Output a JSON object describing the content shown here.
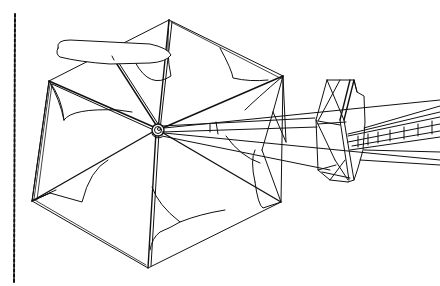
{
  "figure": {
    "type": "technical line drawing",
    "subject": "hexagonal umbrella-shaped deployable sail structure with central hub, paddle blade, and truss boom module",
    "colors": {
      "background": "#ffffff",
      "line": "#111111"
    },
    "components": [
      {
        "id": "dashed-edge-line",
        "label": "dashed vertical border line"
      },
      {
        "id": "hexagonal-sail",
        "label": "hexagonal sail with six panels"
      },
      {
        "id": "central-hub",
        "label": "central hub"
      },
      {
        "id": "paddle-blade",
        "label": "elongated paddle blade on mast"
      },
      {
        "id": "truss-module",
        "label": "boxed truss module"
      },
      {
        "id": "truss-boom",
        "label": "ladder truss boom extending right"
      }
    ]
  }
}
